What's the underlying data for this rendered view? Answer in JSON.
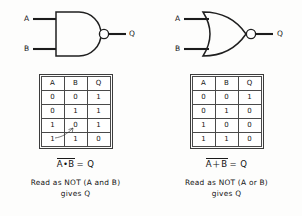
{
  "figure": {
    "background_color": "#fdfdfc",
    "ink_color": "#1a1a1a"
  },
  "panels": [
    {
      "id": "nand",
      "gate": {
        "type": "nand-gate",
        "name": "NAND gate symbol",
        "inputs": [
          "A",
          "B"
        ],
        "output": "Q",
        "has_inversion_bubble": true
      },
      "table": {
        "headers": [
          "A",
          "B",
          "Q"
        ],
        "rows": [
          [
            "0",
            "0",
            "1"
          ],
          [
            "0",
            "1",
            "1"
          ],
          [
            "1",
            "0",
            "1"
          ],
          [
            "1",
            "1",
            "0"
          ]
        ],
        "annotation": "handwritten-arrow"
      },
      "equation": {
        "overbar_part": "A•B",
        "tail": "= Q"
      },
      "caption": {
        "line1": "Read as  NOT (A and B)",
        "line2": "gives Q"
      }
    },
    {
      "id": "nor",
      "gate": {
        "type": "nor-gate",
        "name": "NOR gate symbol",
        "inputs": [
          "A",
          "B"
        ],
        "output": "Q",
        "has_inversion_bubble": true
      },
      "table": {
        "headers": [
          "A",
          "B",
          "Q"
        ],
        "rows": [
          [
            "0",
            "0",
            "1"
          ],
          [
            "0",
            "1",
            "0"
          ],
          [
            "1",
            "0",
            "0"
          ],
          [
            "1",
            "1",
            "0"
          ]
        ],
        "annotation": ""
      },
      "equation": {
        "overbar_part": "A＋B",
        "tail": "= Q"
      },
      "caption": {
        "line1": "Read as  NOT (A or B)",
        "line2": "gives Q"
      }
    }
  ]
}
